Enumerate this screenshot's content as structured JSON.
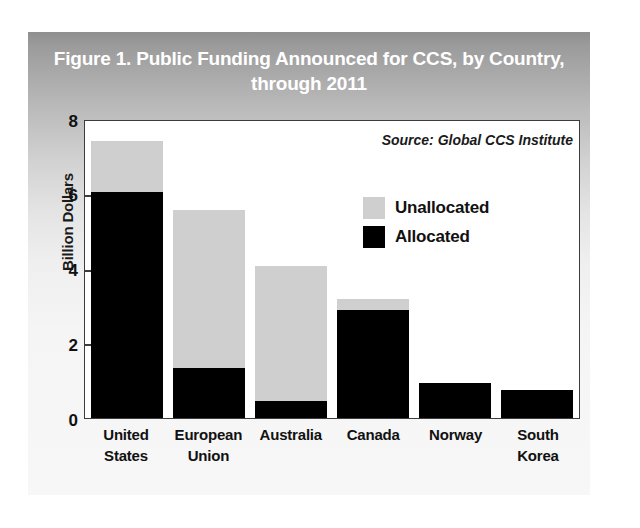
{
  "figure": {
    "title": "Figure 1. Public Funding Announced for CCS, by Country, through 2011",
    "title_line1": "Figure 1. Public Funding Announced for CCS, by Country,",
    "title_line2": "through 2011",
    "source_note": "Source: Global CCS Institute"
  },
  "chart_data": {
    "type": "bar",
    "stacked": true,
    "title": "Figure 1. Public Funding Announced for CCS, by Country, through 2011",
    "xlabel": "",
    "ylabel": "Billion Dollars",
    "ylim": [
      0,
      8
    ],
    "yticks": [
      0,
      2,
      4,
      6,
      8
    ],
    "ytick_labels": [
      "0",
      "2",
      "4",
      "6",
      "8"
    ],
    "grid": false,
    "legend_position": "inside-upper-right",
    "categories": [
      "United States",
      "European Union",
      "Australia",
      "Canada",
      "Norway",
      "South Korea"
    ],
    "category_lines": [
      [
        "United",
        "States"
      ],
      [
        "European",
        "Union"
      ],
      [
        "Australia",
        ""
      ],
      [
        "Canada",
        ""
      ],
      [
        "Norway",
        ""
      ],
      [
        "South",
        "Korea"
      ]
    ],
    "series": [
      {
        "name": "Allocated",
        "color": "#000000",
        "values": [
          6.1,
          1.35,
          0.45,
          2.9,
          0.95,
          0.75
        ]
      },
      {
        "name": "Unallocated",
        "color": "#cfcfcf",
        "values": [
          1.35,
          4.25,
          3.65,
          0.3,
          0.0,
          0.0
        ]
      }
    ],
    "totals": [
      7.45,
      5.6,
      4.1,
      3.2,
      0.95,
      0.75
    ],
    "annotations": [
      "Source: Global CCS Institute"
    ]
  },
  "legend": {
    "items": [
      {
        "label": "Unallocated",
        "color": "#cfcfcf"
      },
      {
        "label": "Allocated",
        "color": "#000000"
      }
    ]
  }
}
